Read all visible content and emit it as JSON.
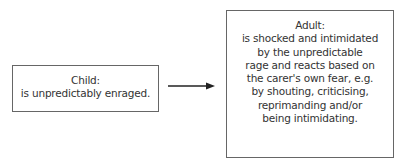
{
  "diagram": {
    "child": {
      "title": "Child:",
      "lines": [
        "is unpredictably enraged."
      ]
    },
    "arrow": {
      "direction": "right",
      "color": "#222222"
    },
    "adult": {
      "title": "Adult:",
      "lines": [
        "is shocked and intimidated",
        "by the unpredictable",
        "rage and reacts based on",
        "the carer's own fear, e.g.",
        "by shouting, criticising,",
        "reprimanding and/or",
        "being intimidating."
      ]
    },
    "colors": {
      "border": "#666666",
      "text": "#333333",
      "background": "#ffffff"
    }
  }
}
